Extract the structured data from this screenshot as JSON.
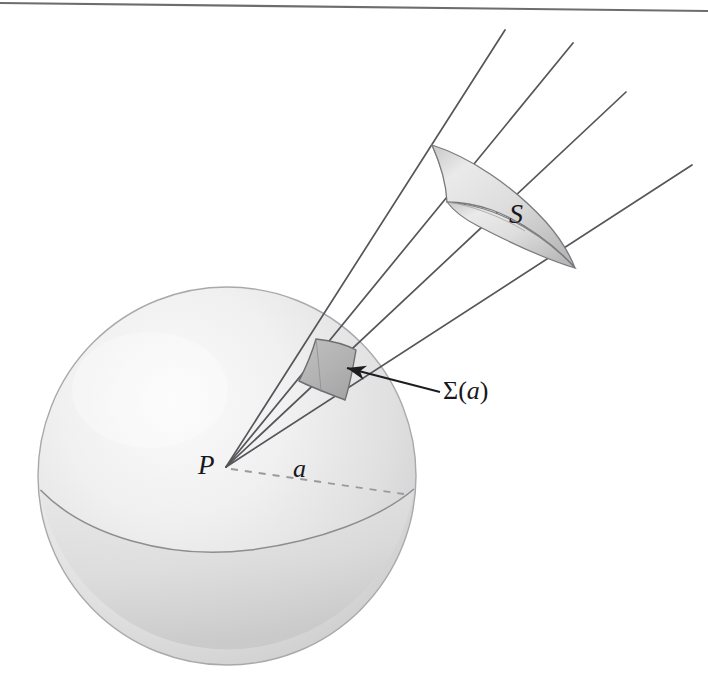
{
  "figure": {
    "background_color": "#ffffff",
    "width": 708,
    "height": 689,
    "top_rule": {
      "name": "page-top-rule",
      "x1": 0,
      "y1": 3,
      "x2": 708,
      "y2": 11,
      "color": "#6d6d70",
      "stroke_width": 2.2
    }
  },
  "labels": {
    "point_P": "P",
    "radius_a": "a",
    "surface_S": "S",
    "patch_sigma_greek": "Σ",
    "patch_sigma_open": "(",
    "patch_sigma_arg": "a",
    "patch_sigma_close": ")"
  },
  "colors": {
    "line": "#55555a",
    "line_dark": "#2f2f33",
    "text": "#18181a",
    "sphere_light": "#f4f4f4",
    "sphere_mid": "#e2e2e2",
    "sphere_shadow": "#cfcfcf",
    "sphere_edge": "#a9a9ad",
    "patch_fill": "#b9b9b9",
    "patch_edge": "#6e6e72",
    "cap_light": "#ededed",
    "cap_mid": "#d2d2d2",
    "cap_dark": "#a8a8ac",
    "dashed_line": "#9a9a9e"
  },
  "sphere": {
    "name": "sphere-body",
    "center_x": 227,
    "center_y": 476,
    "radius": 189,
    "equator": {
      "name": "sphere-equator",
      "description": "horizon ellipse arc across the lower half of the sphere",
      "color": "#8d8d92",
      "stroke_width": 1.5
    }
  },
  "apex": {
    "name": "cone-apex-point",
    "x": 226,
    "y": 467,
    "label": "P"
  },
  "radius_line": {
    "name": "radius-dashed-line",
    "x1": 231,
    "y1": 469,
    "x2": 404,
    "y2": 494,
    "dash": "7 7",
    "color": "#9a9a9e",
    "label": "a"
  },
  "rays": [
    {
      "name": "cone-ray-1",
      "x1": 226,
      "y1": 467,
      "x2": 505,
      "y2": 30,
      "color": "#55555a"
    },
    {
      "name": "cone-ray-2",
      "x1": 226,
      "y1": 467,
      "x2": 573,
      "y2": 43,
      "color": "#55555a"
    },
    {
      "name": "cone-ray-3",
      "x1": 226,
      "y1": 467,
      "x2": 626,
      "y2": 92,
      "color": "#55555a"
    },
    {
      "name": "cone-ray-4",
      "x1": 226,
      "y1": 467,
      "x2": 692,
      "y2": 165,
      "color": "#55555a"
    }
  ],
  "surface_S": {
    "name": "outer-surface-patch-S",
    "label": "S",
    "description": "curved saddle-shaped quadrilateral patch cut by the cone far from the sphere",
    "fill_light": "#f2f2f2",
    "fill_mid": "#dcdcdc",
    "fill_dark": "#b4b4b4",
    "edge": "#7a7a7e",
    "corners": [
      {
        "x": 432,
        "y": 145
      },
      {
        "x": 520,
        "y": 180
      },
      {
        "x": 575,
        "y": 268
      },
      {
        "x": 447,
        "y": 203
      }
    ]
  },
  "patch_sigma": {
    "name": "sphere-surface-patch-sigma",
    "label": "Σ(a)",
    "description": "small curved quadrilateral where the cone meets the sphere surface",
    "fill": "#b9b9b9",
    "edge": "#6e6e72",
    "corners": [
      {
        "x": 316,
        "y": 339
      },
      {
        "x": 355,
        "y": 349
      },
      {
        "x": 345,
        "y": 399
      },
      {
        "x": 300,
        "y": 381
      }
    ]
  },
  "annotation_arrow": {
    "name": "sigma-callout-arrow",
    "from_x": 440,
    "from_y": 392,
    "to_x": 344,
    "to_y": 367,
    "color": "#1d1d20",
    "stroke_width": 2.2,
    "head_size": 12
  }
}
